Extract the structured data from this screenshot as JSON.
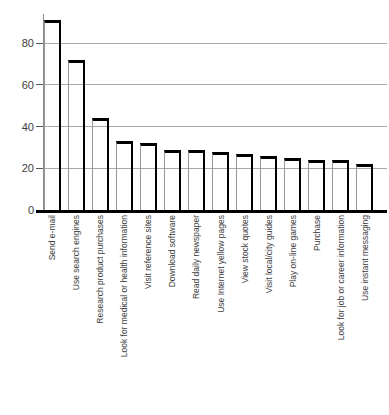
{
  "chart_data": {
    "type": "bar",
    "title": "",
    "xlabel": "",
    "ylabel": "",
    "categories": [
      "Send e-mail",
      "Use search engines",
      "Research product purchases",
      "Look for medical or health information",
      "Visit reference sites",
      "Download software",
      "Read daily newspaper",
      "Use Internet yellow pages",
      "View stock quotes",
      "Visit local/city guides",
      "Play on-line games",
      "Purchase",
      "Look for job or career information",
      "Use instant messaging"
    ],
    "values": [
      91,
      72,
      44,
      33,
      32,
      29,
      29,
      28,
      27,
      26,
      25,
      24,
      24,
      22
    ],
    "yticks": [
      0,
      20,
      40,
      60,
      80
    ],
    "ylim": [
      0,
      95
    ],
    "grid": "horizontal",
    "legend": "none",
    "bar_fill": "transparent",
    "bar_border_color": "#000000",
    "bar_left_edge_color": "#999999",
    "gridline_color": "#a8a8a8",
    "axis_color": "#000000",
    "tick_label_color": "#3d3d3d",
    "category_label_color": "#3d3d3d"
  }
}
